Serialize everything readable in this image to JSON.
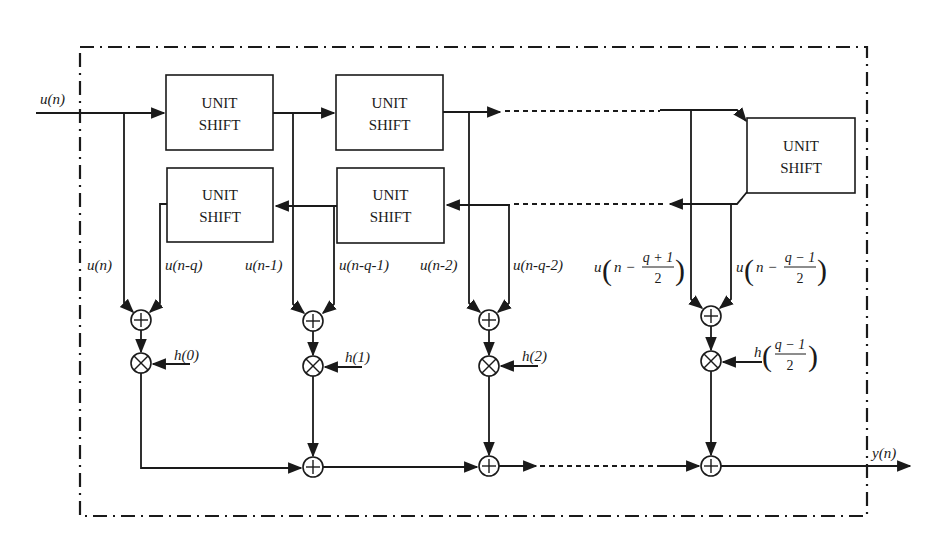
{
  "diagram": {
    "colors": {
      "ink": "#1a1a1a",
      "background": "#ffffff"
    },
    "boxes": [
      {
        "id": "shift-top-1",
        "line1": "UNIT",
        "line2": "SHIFT"
      },
      {
        "id": "shift-top-2",
        "line1": "UNIT",
        "line2": "SHIFT"
      },
      {
        "id": "shift-bottom-1",
        "line1": "UNIT",
        "line2": "SHIFT"
      },
      {
        "id": "shift-bottom-2",
        "line1": "UNIT",
        "line2": "SHIFT"
      },
      {
        "id": "shift-turn",
        "line1": "UNIT",
        "line2": "SHIFT"
      }
    ],
    "input_label": "u(n)",
    "output_label": "y(n)",
    "taps": [
      {
        "left": "u(n)",
        "right": "u(n-q)",
        "coef": "h(0)"
      },
      {
        "left": "u(n-1)",
        "right": "u(n-q-1)",
        "coef": "h(1)"
      },
      {
        "left": "u(n-2)",
        "right": "u(n-q-2)",
        "coef": "h(2)"
      },
      {
        "left_prefix": "u",
        "left_frac": {
          "n": "n −",
          "num": "q + 1",
          "den": "2"
        },
        "right_prefix": "u",
        "right_frac": {
          "n": "n −",
          "num": "q − 1",
          "den": "2"
        },
        "coef_prefix": "h",
        "coef_frac": {
          "num": "q − 1",
          "den": "2"
        }
      }
    ],
    "operators": {
      "adder": "⊕",
      "multiplier": "⊗"
    }
  }
}
